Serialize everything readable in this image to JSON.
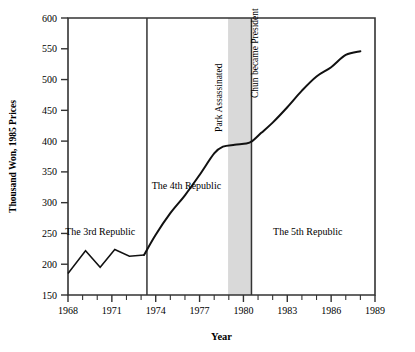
{
  "chart_data": {
    "type": "line",
    "title": "",
    "xlabel": "Year",
    "ylabel": "Thousand Won, 1985 Prices",
    "xlim": [
      1968,
      1989
    ],
    "ylim": [
      150,
      600
    ],
    "grid": false,
    "legend": "none",
    "x_ticks": [
      1968,
      1969,
      1970,
      1971,
      1972,
      1973,
      1974,
      1975,
      1976,
      1977,
      1978,
      1979,
      1980,
      1981,
      1982,
      1983,
      1984,
      1985,
      1986,
      1987,
      1988,
      1989
    ],
    "x_tick_labels": [
      "1968",
      "",
      "",
      "1971",
      "",
      "",
      "1974",
      "",
      "",
      "1977",
      "",
      "",
      "1980",
      "",
      "",
      "1983",
      "",
      "",
      "1986",
      "",
      "",
      "1989"
    ],
    "y_ticks": [
      150,
      200,
      250,
      300,
      350,
      400,
      450,
      500,
      550,
      600
    ],
    "y_tick_labels": [
      "150",
      "200",
      "250",
      "300",
      "350",
      "400",
      "450",
      "500",
      "550",
      "600"
    ],
    "series": [
      {
        "name": "Real per capita income",
        "x": [
          1968.0,
          1969.2,
          1970.2,
          1971.2,
          1972.2,
          1973.2,
          1974.0,
          1975.0,
          1976.0,
          1977.0,
          1978.0,
          1978.6,
          1979.4,
          1980.2,
          1980.6,
          1981.2,
          1982.0,
          1983.0,
          1984.0,
          1985.0,
          1986.0,
          1987.0,
          1988.0
        ],
        "values": [
          185,
          222,
          195,
          224,
          213,
          215,
          248,
          283,
          312,
          345,
          380,
          391,
          394,
          396,
          400,
          413,
          430,
          455,
          482,
          505,
          520,
          540,
          546
        ]
      }
    ],
    "regions": [
      {
        "label": "The 3rd Republic",
        "x_start": 1968,
        "x_end": 1973.4,
        "label_x": 1970.2,
        "label_y": 248
      },
      {
        "label": "The 4th Republic",
        "x_start": 1973.4,
        "x_end": 1980.55,
        "label_x": 1976.1,
        "label_y": 322
      },
      {
        "label": "The 5th Republic",
        "x_start": 1980.55,
        "x_end": 1989,
        "label_x": 1984.4,
        "label_y": 247
      }
    ],
    "dividers": [
      {
        "name": "start-4th-republic",
        "x": 1973.4
      },
      {
        "name": "chun-became-president",
        "x": 1980.55
      }
    ],
    "shaded_band": {
      "x_start": 1978.95,
      "x_end": 1980.55,
      "color": "#d9d9d9"
    },
    "event_labels": [
      {
        "label": "Park Assassinated",
        "x": 1978.5,
        "y_top": 415,
        "orientation": "vertical"
      },
      {
        "label": "Chun became President",
        "x": 1981.0,
        "y_top": 470,
        "orientation": "vertical"
      }
    ],
    "colors": {
      "line": "#111111",
      "axis": "#333333",
      "band": "#d9d9d9",
      "background": "#ffffff"
    }
  }
}
